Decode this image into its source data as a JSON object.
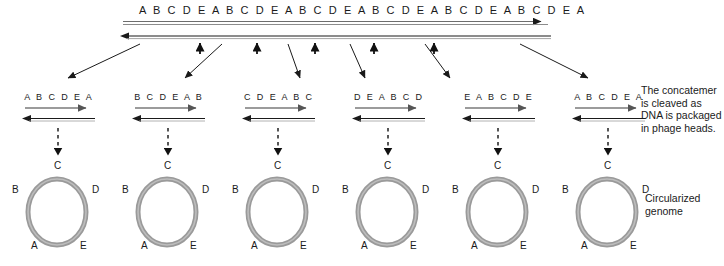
{
  "diagram": {
    "title_sequence": "A B C D E A B C D E A B C D E A B C D E A B C D E A B C D E A",
    "concatemer": {
      "name": "concatemer-duplex",
      "top_strand_direction": "right",
      "bottom_strand_direction": "left",
      "cleavage_site_count": 5
    },
    "segments": [
      {
        "label": "A B C D E A",
        "id": "segment-1"
      },
      {
        "label": "B C D E A B",
        "id": "segment-2"
      },
      {
        "label": "C D E A B C",
        "id": "segment-3"
      },
      {
        "label": "D E A B C D",
        "id": "segment-4"
      },
      {
        "label": "E A B C D E",
        "id": "segment-5"
      },
      {
        "label": "A B C D E A",
        "id": "segment-6"
      }
    ],
    "circle_labels": {
      "top": "C",
      "upper_left": "B",
      "upper_right": "D",
      "lower_left": "A",
      "lower_right": "E"
    },
    "annotations": {
      "cleavage_note": "The concatemer is cleaved as DNA is packaged in phage heads.",
      "circularized_note": "Circularized genome"
    },
    "colors": {
      "line_dark": "#1a1a1a",
      "line_grey": "#8c8c8c",
      "ring_grey": "#999999",
      "ring_highlight": "#b3b3b3",
      "background": "#ffffff",
      "text": "#1a1a1a"
    }
  }
}
